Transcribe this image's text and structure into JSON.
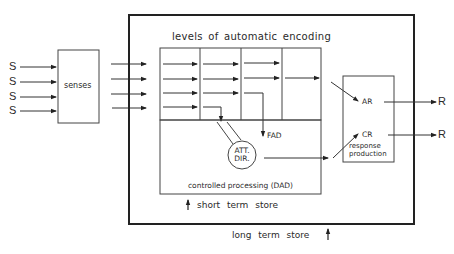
{
  "diagram": {
    "type": "information-processing-model",
    "inputs": [
      "S",
      "S",
      "S",
      "S"
    ],
    "outputs": [
      "R",
      "R"
    ],
    "senses_label": "senses",
    "encoding_title": "levels of automatic encoding",
    "fad_label": "FAD",
    "att_dir_label_line1": "ATT.",
    "att_dir_label_line2": "DIR.",
    "controlled_processing_label": "controlled processing (DAD)",
    "short_term_store_label": "short term store",
    "long_term_store_label": "long term store",
    "ar_label": "AR",
    "cr_label": "CR",
    "response_label_line1": "response",
    "response_label_line2": "production"
  },
  "colors": {
    "line": "#222222",
    "background": "#ffffff"
  }
}
